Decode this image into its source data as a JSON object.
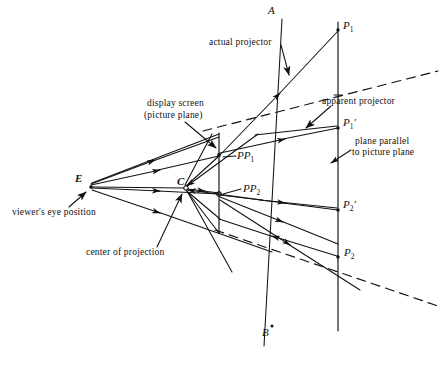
{
  "figure": {
    "type": "technical-line-diagram",
    "background_color": "#ffffff",
    "ink_color": "#111111"
  },
  "captions": [
    {
      "id": "actual-projector",
      "text": "actual projector",
      "x": 209,
      "y": 42
    },
    {
      "id": "display-screen",
      "text": "display screen",
      "x": 147,
      "y": 103
    },
    {
      "id": "picture-plane",
      "text": "(picture plane)",
      "x": 144,
      "y": 115
    },
    {
      "id": "apparent-projector",
      "text": "apparent projector",
      "x": 322,
      "y": 101
    },
    {
      "id": "plane-parallel-1",
      "text": "plane parallel",
      "x": 355,
      "y": 141
    },
    {
      "id": "plane-parallel-2",
      "text": "to picture plane",
      "x": 352,
      "y": 152
    },
    {
      "id": "viewers-eye-position",
      "text": "viewer's eye position",
      "x": 12,
      "y": 212
    },
    {
      "id": "center-of-projection",
      "text": "center of projection",
      "x": 86,
      "y": 252
    }
  ],
  "point_labels": [
    {
      "id": "point-A",
      "text": "A",
      "x": 268,
      "y": 6
    },
    {
      "id": "point-B",
      "text": "B",
      "x": 263,
      "y": 331
    },
    {
      "id": "point-E",
      "text": "E",
      "x": 76,
      "y": 174
    },
    {
      "id": "point-C",
      "text": "C",
      "x": 178,
      "y": 177
    },
    {
      "id": "point-P1",
      "text": "P",
      "sub": "1",
      "prime": "",
      "x": 343,
      "y": 22
    },
    {
      "id": "point-P1-prime",
      "text": "P",
      "sub": "1",
      "prime": "′",
      "x": 343,
      "y": 119
    },
    {
      "id": "point-P2-prime",
      "text": "P",
      "sub": "2",
      "prime": "′",
      "x": 343,
      "y": 201
    },
    {
      "id": "point-P2",
      "text": "P",
      "sub": "2",
      "prime": "",
      "x": 344,
      "y": 249
    },
    {
      "id": "point-PP1",
      "text": "PP",
      "sub": "1",
      "prime": "",
      "x": 237,
      "y": 152
    },
    {
      "id": "point-PP2",
      "text": "PP",
      "sub": "2",
      "prime": "",
      "x": 243,
      "y": 185
    }
  ],
  "geometry": {
    "picture_plane_line": {
      "x": 219,
      "y1": 134,
      "y2": 232
    },
    "parallel_plane_line": {
      "x": 338,
      "y1": 22,
      "y2": 330
    },
    "eye_point": {
      "x": 90,
      "y": 186
    },
    "center_of_projection_point": {
      "x": 185,
      "y": 188
    },
    "pp1_point": {
      "x": 219,
      "y": 155
    },
    "pp2_point": {
      "x": 219,
      "y": 193
    },
    "p1_point": {
      "x": 338,
      "y": 30
    },
    "p1_prime_point": {
      "x": 338,
      "y": 128
    },
    "p2_prime_point": {
      "x": 338,
      "y": 210
    },
    "p2_point": {
      "x": 338,
      "y": 258
    },
    "line_AB": {
      "x1": 281,
      "y1": 18,
      "x2": 265,
      "y2": 345
    },
    "dashed_upper": {
      "x1": 205,
      "y1": 130,
      "x2": 437,
      "y2": 72
    },
    "dashed_lower": {
      "x1": 216,
      "y1": 231,
      "x2": 437,
      "y2": 305
    }
  }
}
